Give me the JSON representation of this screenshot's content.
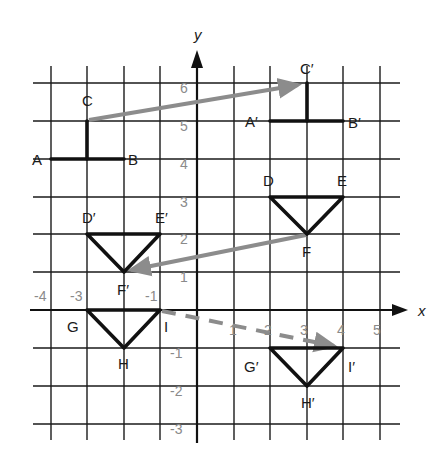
{
  "axes": {
    "x_label": "x",
    "y_label": "y",
    "x_ticks": [
      "-4",
      "-3",
      "-1",
      "1",
      "2",
      "3",
      "4",
      "5"
    ],
    "y_ticks": [
      "6",
      "5",
      "4",
      "3",
      "2",
      "1",
      "-1",
      "-2",
      "-3"
    ],
    "x_range": [
      -4,
      5
    ],
    "y_range": [
      -3,
      6
    ]
  },
  "figures": {
    "original_T": {
      "points": {
        "A": [
          -4,
          4
        ],
        "B": [
          -2,
          4
        ],
        "C": [
          -3,
          5
        ]
      },
      "labels": {
        "A": "A",
        "B": "B",
        "C": "C"
      }
    },
    "image_T": {
      "points": {
        "A'": [
          1,
          5
        ],
        "B'": [
          3,
          5
        ],
        "C'": [
          2,
          6
        ]
      },
      "labels": {
        "A": "A′",
        "B": "B′",
        "C": "C′"
      }
    },
    "original_triangle_DEF": {
      "points": {
        "D": [
          2,
          3
        ],
        "E": [
          4,
          3
        ],
        "F": [
          3,
          2
        ]
      },
      "labels": {
        "D": "D",
        "E": "E",
        "F": "F"
      }
    },
    "image_triangle_DEF": {
      "points": {
        "D'": [
          -3,
          2
        ],
        "E'": [
          -1,
          2
        ],
        "F'": [
          -2,
          1
        ]
      },
      "labels": {
        "D": "D′",
        "E": "E′",
        "F": "F′"
      }
    },
    "original_triangle_GHI": {
      "points": {
        "G": [
          -3,
          0
        ],
        "H": [
          -2,
          -1
        ],
        "I": [
          -1,
          0
        ]
      },
      "labels": {
        "G": "G",
        "H": "H",
        "I": "I"
      }
    },
    "image_triangle_GHI": {
      "points": {
        "G'": [
          2,
          -1
        ],
        "H'": [
          3,
          -2
        ],
        "I'": [
          4,
          -1
        ]
      },
      "labels": {
        "G": "G′",
        "H": "H′",
        "I": "I′"
      }
    }
  },
  "translation_arrows": [
    {
      "from": "C",
      "to": "C′",
      "style": "solid"
    },
    {
      "from": "F",
      "to": "F′",
      "style": "solid"
    },
    {
      "from": "I",
      "to": "I′",
      "style": "dashed"
    }
  ],
  "colors": {
    "grid": "#1a1a1a",
    "shape": "#111111",
    "arrow": "#8c8c8c",
    "tick_label": "#8a8a8a"
  }
}
